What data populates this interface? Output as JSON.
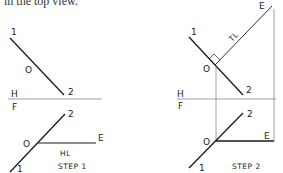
{
  "caption": "in the top view.",
  "step1": {
    "title": "STEP 1",
    "labels": {
      "top_1": "1",
      "top_o": "O",
      "top_2": "2",
      "fold_h": "H",
      "fold_f": "F",
      "front_2": "2",
      "front_o": "O",
      "front_e": "E",
      "front_1": "1",
      "hl": "HL"
    }
  },
  "step2": {
    "title": "STEP 2",
    "labels": {
      "top_1": "1",
      "top_o": "O",
      "top_2": "2",
      "top_e": "E",
      "tl": "TL",
      "fold_h": "H",
      "fold_f": "F",
      "front_2": "2",
      "front_o": "O",
      "front_e": "E",
      "front_1": "1"
    }
  },
  "colors": {
    "line": "#1a1a1a",
    "projection": "#888888"
  }
}
